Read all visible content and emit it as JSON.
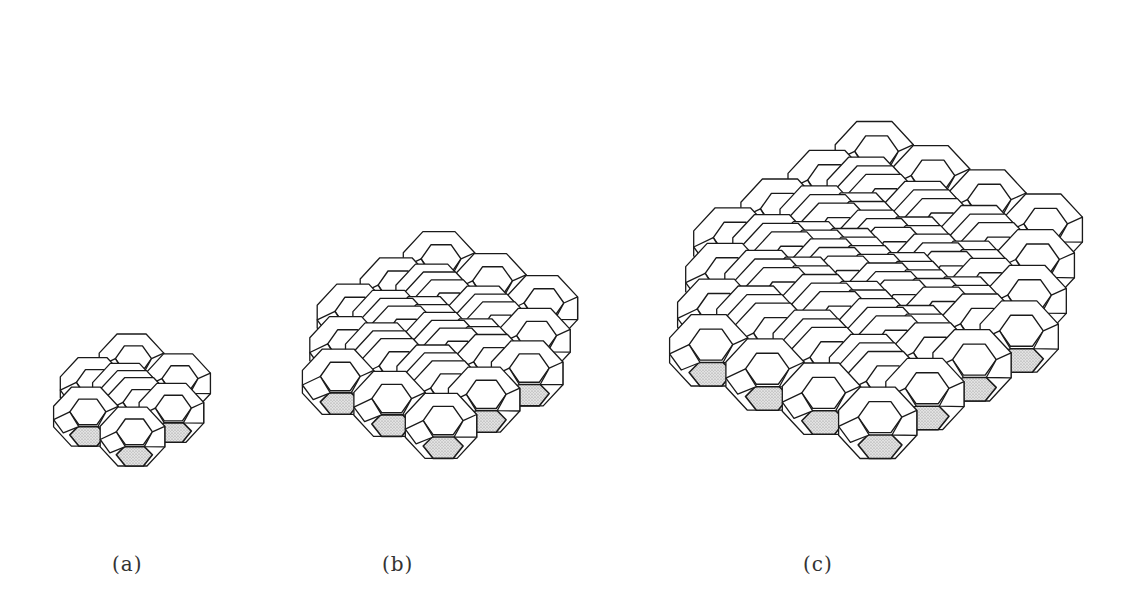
{
  "figure": {
    "shade_color": "#c8c8c8",
    "line_color": "#1a1a1a",
    "panels": [
      {
        "id": "a",
        "label": "(a)",
        "n": 2,
        "cx": 132,
        "cy": 400,
        "size": 19,
        "label_x": 112,
        "label_y": 552
      },
      {
        "id": "b",
        "label": "(b)",
        "n": 3,
        "cx": 440,
        "cy": 345,
        "size": 21,
        "label_x": 382,
        "label_y": 552
      },
      {
        "id": "c",
        "label": "(c)",
        "n": 4,
        "cx": 876,
        "cy": 290,
        "size": 23,
        "label_x": 803,
        "label_y": 552
      }
    ]
  }
}
